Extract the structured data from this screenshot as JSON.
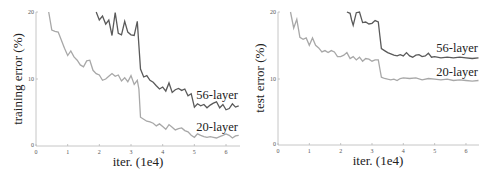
{
  "chart_data": [
    {
      "type": "line",
      "title": "",
      "xlabel": "iter. (1e4)",
      "ylabel": "training error (%)",
      "xlim": [
        0,
        6.4
      ],
      "ylim": [
        0,
        20
      ],
      "xticks": [
        0,
        1,
        2,
        3,
        4,
        5,
        6
      ],
      "yticks": [
        0,
        10,
        20
      ],
      "grid": false,
      "legend": "inline labels at right end of lines",
      "series": [
        {
          "name": "56-layer",
          "color": "#5a5a5a",
          "x": [
            1.9,
            2.0,
            2.1,
            2.2,
            2.3,
            2.4,
            2.5,
            2.6,
            2.7,
            2.8,
            2.9,
            3.0,
            3.1,
            3.2,
            3.25,
            3.3,
            3.4,
            3.5,
            3.6,
            3.7,
            3.8,
            3.9,
            4.0,
            4.1,
            4.2,
            4.3,
            4.4,
            4.5,
            4.6,
            4.7,
            4.8,
            4.9,
            5.0,
            5.1,
            5.2,
            5.3,
            5.4,
            5.5,
            5.6,
            5.7,
            5.8,
            5.9,
            6.0,
            6.1,
            6.2,
            6.3,
            6.4
          ],
          "values": [
            20.0,
            18.8,
            19.4,
            18.2,
            18.8,
            16.5,
            19.9,
            16.8,
            16.6,
            18.6,
            17.0,
            16.6,
            16.5,
            18.6,
            15.0,
            11.5,
            10.3,
            10.5,
            9.8,
            9.5,
            9.0,
            8.5,
            8.8,
            8.2,
            9.4,
            8.0,
            8.4,
            8.6,
            8.3,
            8.5,
            7.5,
            7.8,
            5.8,
            6.3,
            6.0,
            6.2,
            5.7,
            6.1,
            6.4,
            6.6,
            5.7,
            6.2,
            5.4,
            5.6,
            6.3,
            5.8,
            6.0
          ]
        },
        {
          "name": "20-layer",
          "color": "#a8a8a8",
          "x": [
            0.4,
            0.5,
            0.6,
            0.7,
            0.8,
            0.9,
            1.0,
            1.1,
            1.2,
            1.3,
            1.4,
            1.5,
            1.6,
            1.7,
            1.8,
            1.9,
            2.0,
            2.1,
            2.2,
            2.3,
            2.4,
            2.5,
            2.6,
            2.7,
            2.8,
            2.9,
            3.0,
            3.1,
            3.2,
            3.25,
            3.3,
            3.4,
            3.5,
            3.6,
            3.7,
            3.8,
            3.9,
            4.0,
            4.1,
            4.2,
            4.3,
            4.4,
            4.5,
            4.6,
            4.7,
            4.8,
            4.9,
            5.0,
            5.1,
            5.2,
            5.3,
            5.4,
            5.5,
            5.6,
            5.7,
            5.8,
            5.9,
            6.0,
            6.1,
            6.2,
            6.3,
            6.4
          ],
          "values": [
            20.0,
            17.3,
            17.1,
            17.0,
            15.8,
            14.6,
            13.5,
            14.2,
            13.3,
            12.8,
            12.1,
            11.8,
            12.7,
            12.8,
            11.3,
            10.8,
            10.6,
            9.8,
            10.0,
            10.4,
            10.8,
            10.4,
            10.6,
            9.7,
            10.2,
            9.6,
            10.5,
            9.2,
            9.8,
            8.5,
            4.3,
            4.0,
            3.7,
            3.6,
            3.4,
            3.0,
            3.3,
            2.9,
            2.5,
            3.2,
            2.8,
            2.4,
            2.6,
            2.7,
            2.3,
            2.1,
            1.6,
            1.3,
            1.8,
            1.6,
            1.4,
            1.3,
            1.4,
            1.3,
            1.2,
            1.4,
            1.6,
            1.8,
            1.6,
            1.2,
            1.5,
            1.6
          ]
        }
      ]
    },
    {
      "type": "line",
      "title": "",
      "xlabel": "iter. (1e4)",
      "ylabel": "test error (%)",
      "xlim": [
        0,
        6.4
      ],
      "ylim": [
        0,
        20
      ],
      "xticks": [
        0,
        1,
        2,
        3,
        4,
        5,
        6
      ],
      "yticks": [
        0,
        10,
        20
      ],
      "grid": false,
      "legend": "inline labels at right end of lines",
      "series": [
        {
          "name": "56-layer",
          "color": "#5a5a5a",
          "x": [
            2.2,
            2.3,
            2.35,
            2.4,
            2.5,
            2.6,
            2.7,
            2.8,
            2.9,
            3.0,
            3.1,
            3.2,
            3.25,
            3.3,
            3.4,
            3.5,
            3.6,
            3.7,
            3.8,
            3.9,
            4.0,
            4.1,
            4.2,
            4.3,
            4.4,
            4.5,
            4.6,
            4.7,
            4.8,
            4.9,
            5.0,
            5.2,
            5.4,
            5.6,
            5.8,
            6.0,
            6.2,
            6.4
          ],
          "values": [
            20.0,
            19.8,
            18.8,
            18.0,
            19.9,
            20.0,
            18.4,
            18.5,
            18.2,
            18.3,
            18.7,
            18.5,
            16.5,
            14.5,
            14.2,
            13.9,
            13.7,
            13.5,
            13.4,
            13.6,
            13.4,
            13.9,
            13.4,
            13.2,
            13.5,
            13.6,
            13.3,
            13.4,
            13.8,
            13.2,
            13.3,
            13.1,
            13.2,
            13.1,
            13.2,
            13.1,
            13.0,
            13.1
          ]
        },
        {
          "name": "20-layer",
          "color": "#a8a8a8",
          "x": [
            0.4,
            0.5,
            0.6,
            0.7,
            0.8,
            0.9,
            1.0,
            1.1,
            1.2,
            1.3,
            1.4,
            1.5,
            1.6,
            1.7,
            1.8,
            1.9,
            2.0,
            2.1,
            2.2,
            2.3,
            2.4,
            2.5,
            2.6,
            2.7,
            2.8,
            2.9,
            3.0,
            3.1,
            3.2,
            3.25,
            3.3,
            3.4,
            3.5,
            3.6,
            3.7,
            3.8,
            3.9,
            4.0,
            4.2,
            4.4,
            4.6,
            4.8,
            5.0,
            5.2,
            5.4,
            5.6,
            5.8,
            6.0,
            6.2,
            6.4
          ],
          "values": [
            20.0,
            17.6,
            18.9,
            16.2,
            15.9,
            16.1,
            15.0,
            16.1,
            15.0,
            14.6,
            14.0,
            14.2,
            13.9,
            14.2,
            14.0,
            13.3,
            13.3,
            13.5,
            13.9,
            13.0,
            13.3,
            12.8,
            13.2,
            12.6,
            13.0,
            12.9,
            12.6,
            12.8,
            12.8,
            11.5,
            10.2,
            10.0,
            9.9,
            9.8,
            9.9,
            9.7,
            10.0,
            10.1,
            10.0,
            10.1,
            9.8,
            10.0,
            9.9,
            9.8,
            9.9,
            9.7,
            9.8,
            9.7,
            9.6,
            9.7
          ]
        }
      ]
    }
  ],
  "charts": [
    {
      "ylabel": "training error (%)",
      "xlabel": "iter. (1e4)",
      "ytick_labels": [
        "0",
        "10",
        "20"
      ],
      "xtick_labels": [
        "0",
        "1",
        "2",
        "3",
        "4",
        "5",
        "6"
      ],
      "label_56": "56-layer",
      "label_20": "20-layer"
    },
    {
      "ylabel": "test error (%)",
      "xlabel": "iter. (1e4)",
      "ytick_labels": [
        "0",
        "10",
        "20"
      ],
      "xtick_labels": [
        "0",
        "1",
        "2",
        "3",
        "4",
        "5",
        "6"
      ],
      "label_56": "56-layer",
      "label_20": "20-layer"
    }
  ]
}
